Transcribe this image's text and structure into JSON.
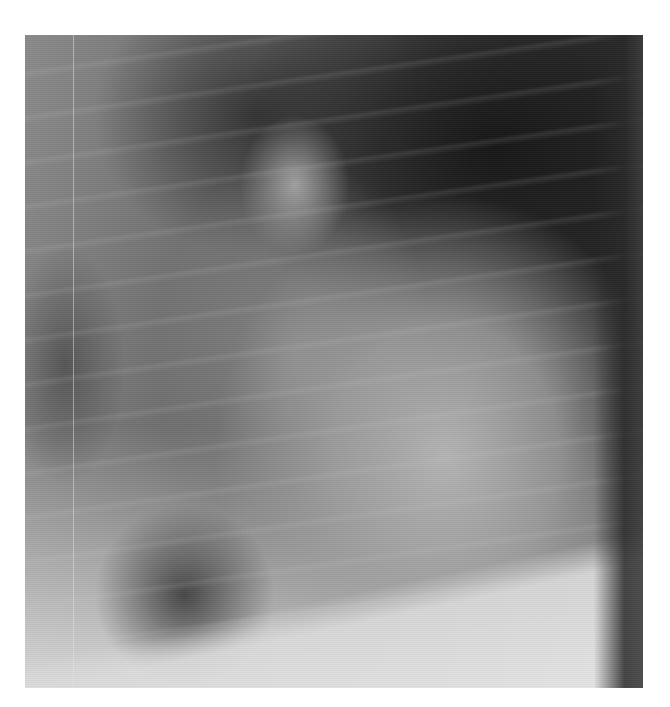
{
  "image": {
    "kind": "grayscale radiograph",
    "description": "Chest X-ray detail showing an enlarged cardiac silhouette with darker lung fields in the upper right and a bright diaphragm along the bottom",
    "background_color": "#ffffff",
    "bounds": {
      "left": 25,
      "top": 35,
      "width": 618,
      "height": 653
    },
    "tones": {
      "darkest": "#1e1e1e",
      "mid": "#7a7a7a",
      "lightest": "#e6e6e6"
    }
  }
}
